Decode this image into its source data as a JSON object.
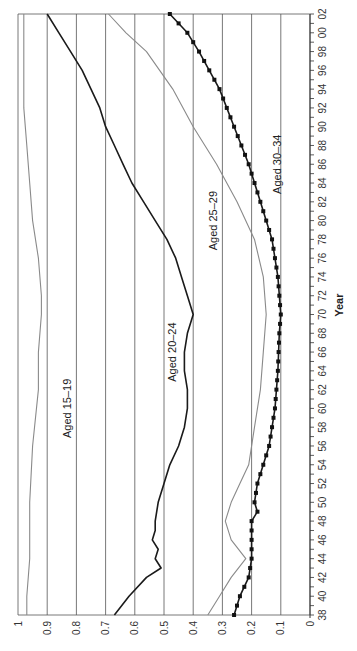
{
  "chart_data": {
    "type": "line",
    "orientation": "rotated-90-counterclockwise",
    "title": "",
    "xlabel": "Year",
    "ylabel": "",
    "xlim": [
      1938,
      2002
    ],
    "ylim": [
      0,
      1
    ],
    "grid": "horizontal-major",
    "x_tick_labels": [
      "38",
      "40",
      "42",
      "44",
      "46",
      "48",
      "50",
      "52",
      "54",
      "56",
      "58",
      "60",
      "62",
      "64",
      "66",
      "68",
      "70",
      "72",
      "74",
      "76",
      "78",
      "80",
      "82",
      "84",
      "86",
      "88",
      "90",
      "92",
      "94",
      "96",
      "98",
      "00",
      "02"
    ],
    "x_ticks": [
      1938,
      1940,
      1942,
      1944,
      1946,
      1948,
      1950,
      1952,
      1954,
      1956,
      1958,
      1960,
      1962,
      1964,
      1966,
      1968,
      1970,
      1972,
      1974,
      1976,
      1978,
      1980,
      1982,
      1984,
      1986,
      1988,
      1990,
      1992,
      1994,
      1996,
      1998,
      2000,
      2002
    ],
    "y_ticks": [
      0,
      0.1,
      0.2,
      0.3,
      0.4,
      0.5,
      0.6,
      0.7,
      0.8,
      0.9,
      1
    ],
    "y_tick_labels": [
      "0",
      "0.1",
      "0.2",
      "0.3",
      "0.4",
      "0.5",
      "0.6",
      "0.7",
      "0.8",
      "0.9",
      "1"
    ],
    "series": [
      {
        "name": "Aged 15–19",
        "label": "Aged 15–19",
        "color": "#8a8a8a",
        "marker": "none",
        "x": [
          1938,
          1940,
          1944,
          1950,
          1956,
          1962,
          1966,
          1970,
          1972,
          1976,
          1980,
          1984,
          1988,
          1992,
          1996,
          2002
        ],
        "values": [
          0.97,
          0.97,
          0.96,
          0.96,
          0.95,
          0.93,
          0.93,
          0.92,
          0.92,
          0.93,
          0.95,
          0.96,
          0.97,
          0.98,
          0.98,
          0.98
        ]
      },
      {
        "name": "Aged 20–24",
        "label": "Aged 20–24",
        "color": "#1a1a1a",
        "marker": "none",
        "x": [
          1938,
          1940,
          1942,
          1943,
          1944,
          1945,
          1946,
          1947,
          1948,
          1950,
          1952,
          1954,
          1956,
          1958,
          1960,
          1962,
          1964,
          1966,
          1968,
          1970,
          1972,
          1974,
          1976,
          1978,
          1980,
          1982,
          1984,
          1986,
          1988,
          1990,
          1992,
          1994,
          1996,
          1998,
          2000,
          2002
        ],
        "values": [
          0.67,
          0.62,
          0.56,
          0.51,
          0.53,
          0.52,
          0.54,
          0.53,
          0.53,
          0.52,
          0.5,
          0.48,
          0.45,
          0.43,
          0.42,
          0.42,
          0.43,
          0.43,
          0.42,
          0.4,
          0.42,
          0.44,
          0.46,
          0.49,
          0.53,
          0.57,
          0.61,
          0.64,
          0.67,
          0.7,
          0.72,
          0.75,
          0.78,
          0.82,
          0.86,
          0.9
        ]
      },
      {
        "name": "Aged 25–29",
        "label": "Aged 25–29",
        "color": "#8a8a8a",
        "marker": "none",
        "x": [
          1938,
          1940,
          1942,
          1944,
          1946,
          1948,
          1950,
          1952,
          1954,
          1958,
          1962,
          1966,
          1970,
          1974,
          1978,
          1982,
          1986,
          1990,
          1994,
          1998,
          2000,
          2002
        ],
        "values": [
          0.35,
          0.31,
          0.27,
          0.22,
          0.27,
          0.29,
          0.27,
          0.24,
          0.21,
          0.19,
          0.17,
          0.16,
          0.15,
          0.16,
          0.19,
          0.25,
          0.32,
          0.4,
          0.47,
          0.56,
          0.63,
          0.69
        ]
      },
      {
        "name": "Aged 30–34",
        "label": "Aged 30–34",
        "color": "#1a1a1a",
        "marker": "square",
        "x": [
          1938,
          1940,
          1942,
          1944,
          1946,
          1948,
          1949,
          1950,
          1952,
          1956,
          1960,
          1964,
          1968,
          1970,
          1974,
          1978,
          1982,
          1986,
          1990,
          1994,
          1998,
          2000,
          2002
        ],
        "values": [
          0.26,
          0.24,
          0.21,
          0.2,
          0.2,
          0.2,
          0.18,
          0.19,
          0.18,
          0.14,
          0.12,
          0.11,
          0.105,
          0.1,
          0.11,
          0.13,
          0.17,
          0.21,
          0.26,
          0.31,
          0.38,
          0.42,
          0.48
        ]
      }
    ],
    "annotations": [
      {
        "text": "Aged 15–19",
        "series": "Aged 15–19",
        "x": 1960,
        "y": 0.82
      },
      {
        "text": "Aged 20–24",
        "series": "Aged 20–24",
        "x": 1966,
        "y": 0.46
      },
      {
        "text": "Aged 25–29",
        "series": "Aged 25–29",
        "x": 1980,
        "y": 0.32
      },
      {
        "text": "Aged 30–34",
        "series": "Aged 30–34",
        "x": 1986,
        "y": 0.1
      }
    ]
  }
}
